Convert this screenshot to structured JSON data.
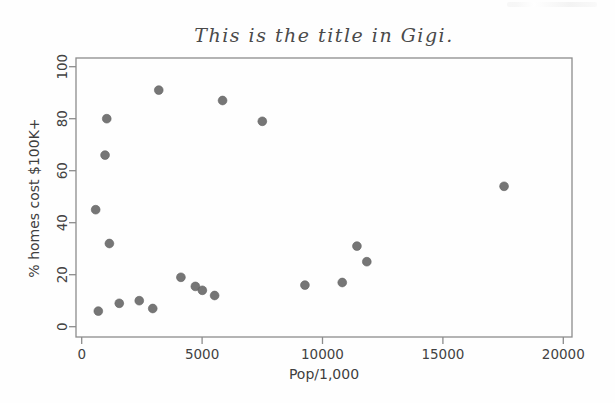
{
  "figure": {
    "title": "This is the title in Gigi.",
    "xlabel": "Pop/1,000",
    "ylabel": "% homes cost $100K+"
  },
  "chart_data": {
    "type": "scatter",
    "title": "This is the title in Gigi.",
    "xlabel": "Pop/1,000",
    "ylabel": "% homes cost $100K+",
    "xlim": [
      0,
      20000
    ],
    "ylim": [
      0,
      100
    ],
    "x_ticks": [
      0,
      5000,
      10000,
      15000,
      20000
    ],
    "y_ticks": [
      0,
      20,
      40,
      60,
      80,
      100
    ],
    "grid": false,
    "legend": null,
    "point_color": "#6f6f6f",
    "axis_color": "#8c8c8c",
    "tick_text_color": "#424242",
    "points": [
      {
        "x": 580,
        "y": 45
      },
      {
        "x": 690,
        "y": 6
      },
      {
        "x": 970,
        "y": 66
      },
      {
        "x": 1040,
        "y": 80
      },
      {
        "x": 1150,
        "y": 32
      },
      {
        "x": 1560,
        "y": 9
      },
      {
        "x": 2390,
        "y": 10
      },
      {
        "x": 2950,
        "y": 7
      },
      {
        "x": 3200,
        "y": 91
      },
      {
        "x": 4120,
        "y": 19
      },
      {
        "x": 4720,
        "y": 15.5
      },
      {
        "x": 5010,
        "y": 14
      },
      {
        "x": 5520,
        "y": 12
      },
      {
        "x": 5850,
        "y": 87
      },
      {
        "x": 7500,
        "y": 79
      },
      {
        "x": 9270,
        "y": 16
      },
      {
        "x": 10820,
        "y": 17
      },
      {
        "x": 11430,
        "y": 31
      },
      {
        "x": 11840,
        "y": 25
      },
      {
        "x": 17540,
        "y": 54
      }
    ]
  }
}
